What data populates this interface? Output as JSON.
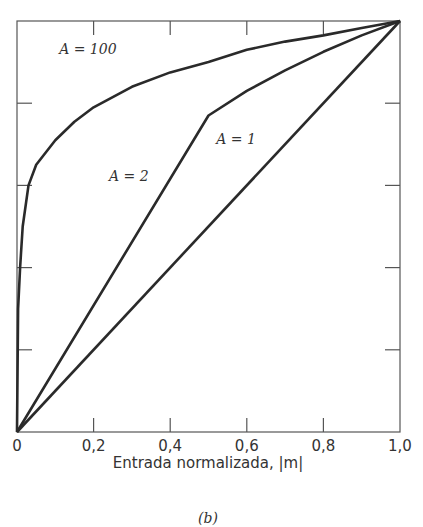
{
  "chart_data": {
    "type": "line",
    "title": "",
    "xlabel": "Entrada normalizada, |m|",
    "ylabel": "",
    "caption": "(b)",
    "xlim": [
      0,
      1
    ],
    "ylim": [
      0,
      1
    ],
    "x_ticks": [
      "0",
      "0,2",
      "0,4",
      "0,6",
      "0,8",
      "1,0"
    ],
    "grid": false,
    "series": [
      {
        "name": "A = 100",
        "x": [
          0,
          0.003,
          0.008,
          0.015,
          0.03,
          0.05,
          0.1,
          0.15,
          0.2,
          0.3,
          0.4,
          0.5,
          0.6,
          0.7,
          0.8,
          0.9,
          1.0
        ],
        "y": [
          0,
          0.3,
          0.4,
          0.5,
          0.6,
          0.65,
          0.71,
          0.755,
          0.79,
          0.84,
          0.875,
          0.9,
          0.93,
          0.95,
          0.965,
          0.983,
          1.0
        ]
      },
      {
        "name": "A = 2",
        "x": [
          0,
          0.5,
          0.6,
          0.7,
          0.8,
          0.9,
          1.0
        ],
        "y": [
          0,
          0.77,
          0.83,
          0.88,
          0.925,
          0.965,
          1.0
        ]
      },
      {
        "name": "A = 1",
        "x": [
          0,
          1
        ],
        "y": [
          0,
          1
        ]
      }
    ],
    "annotations": [
      {
        "text": "A = 100",
        "x": 0.11,
        "y": 0.92
      },
      {
        "text": "A = 2",
        "x": 0.24,
        "y": 0.61
      },
      {
        "text": "A = 1",
        "x": 0.52,
        "y": 0.7
      }
    ]
  }
}
